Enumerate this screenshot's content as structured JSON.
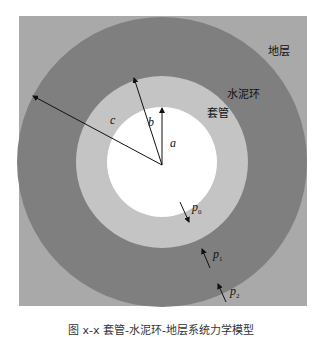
{
  "figure": {
    "caption": "图 x-x 套管-水泥环-地层系统力学模型",
    "caption_note": "Caption is cropped at the bottom edge; text is inferred from partial strokes and may not match the original."
  },
  "layers": {
    "formation": {
      "label": "地层",
      "color": "#a9a9a9"
    },
    "cement": {
      "label": "水泥环",
      "color": "#7f7f7f"
    },
    "casing": {
      "label": "套管",
      "color": "#c4c4c4"
    },
    "bore": {
      "color": "#ffffff"
    }
  },
  "radii": {
    "a": {
      "label": "a"
    },
    "b": {
      "label": "b"
    },
    "c": {
      "label": "c"
    }
  },
  "pressures": {
    "p0": {
      "symbol": "p",
      "sub": "0"
    },
    "p1": {
      "symbol": "p",
      "sub": "1"
    },
    "p2": {
      "symbol": "p",
      "sub": "2"
    }
  }
}
